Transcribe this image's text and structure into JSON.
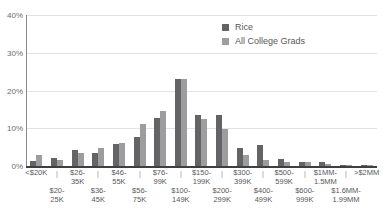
{
  "chart_data": {
    "type": "bar",
    "title": "",
    "xlabel": "",
    "ylabel": "",
    "ylim": [
      0,
      40
    ],
    "yticks": [
      0,
      10,
      20,
      30,
      40
    ],
    "ytick_labels": [
      "0%",
      "10%",
      "20%",
      "30%",
      "40%"
    ],
    "grid": true,
    "legend_position": "top-right",
    "categories": [
      "<$20K",
      "$20-25K",
      "$26-35K",
      "$36-45K",
      "$46-55K",
      "$56-75K",
      "$76-99K",
      "$100-149K",
      "$150-199K",
      "$200-299K",
      "$300-399K",
      "$400-499K",
      "$500-599K",
      "$600-999K",
      "$1MM-1.5MM",
      "$1.6MM-1.99MM",
      ">$2MM"
    ],
    "series": [
      {
        "name": "Rice",
        "color": "#646466",
        "values": [
          1.3,
          2.0,
          4.2,
          3.5,
          5.9,
          7.6,
          12.7,
          23.0,
          13.5,
          13.6,
          4.7,
          5.6,
          1.9,
          1.0,
          1.0,
          0.3,
          0.3
        ]
      },
      {
        "name": "All College Grads",
        "color": "#9d9d9f",
        "values": [
          2.8,
          1.7,
          3.5,
          4.8,
          6.0,
          11.2,
          14.7,
          23.0,
          12.4,
          9.7,
          3.0,
          1.5,
          1.1,
          1.0,
          0.6,
          0.3,
          0.4
        ]
      }
    ]
  },
  "axis": {
    "y_tick_labels": [
      "40%",
      "30%",
      "20%",
      "10%",
      "0%"
    ]
  },
  "legend": {
    "items": [
      {
        "label": "Rice",
        "color": "#646466"
      },
      {
        "label": "All College Grads",
        "color": "#9d9d9f"
      }
    ]
  },
  "x_axis_labels_row0": [
    {
      "line1": "<$20K",
      "line2": ""
    },
    {
      "line1": "$26-",
      "line2": "35K"
    },
    {
      "line1": "$46-",
      "line2": "55K"
    },
    {
      "line1": "$76-",
      "line2": "99K"
    },
    {
      "line1": "$150-",
      "line2": "199K"
    },
    {
      "line1": "$300-",
      "line2": "399K"
    },
    {
      "line1": "$500-",
      "line2": "599K"
    },
    {
      "line1": "$1MM-",
      "line2": "1.5MM"
    },
    {
      "line1": ">$2MM",
      "line2": ""
    }
  ],
  "x_axis_labels_row1": [
    {
      "line1": "$20-",
      "line2": "25K"
    },
    {
      "line1": "$36-",
      "line2": "45K"
    },
    {
      "line1": "$56-",
      "line2": "75K"
    },
    {
      "line1": "$100-",
      "line2": "149K"
    },
    {
      "line1": "$200-",
      "line2": "299K"
    },
    {
      "line1": "$400-",
      "line2": "499K"
    },
    {
      "line1": "$600-",
      "line2": "999K"
    },
    {
      "line1": "$1.6MM-",
      "line2": "1.99MM"
    }
  ]
}
